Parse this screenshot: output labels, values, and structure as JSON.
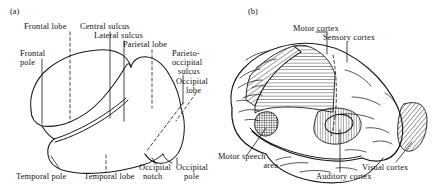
{
  "figure": {
    "background_color": "#ffffff",
    "ink_color": "#1a1a1a",
    "width": 436,
    "height": 189
  },
  "panels": [
    {
      "id": "a",
      "marker": "(a)",
      "title": "Lateral view of cerebral hemisphere with lobes and landmarks",
      "labels": [
        {
          "name": "frontal-lobe",
          "text": "Frontal lobe",
          "leader": "dashed-vertical"
        },
        {
          "name": "central-sulcus",
          "text": "Central sulcus",
          "leader": "solid-vertical"
        },
        {
          "name": "lateral-sulcus",
          "text": "Lateral sulcus",
          "leader": "solid-vertical"
        },
        {
          "name": "parietal-lobe",
          "text": "Parietal lobe",
          "leader": "dashed-vertical"
        },
        {
          "name": "frontal-pole",
          "text": "Frontal\npole",
          "leader": "solid-vertical"
        },
        {
          "name": "parieto-occipital-sulcus",
          "text": "Parieto-\noccipital\nsulcus",
          "leader": "solid-vertical"
        },
        {
          "name": "occipital-lobe",
          "text": "Occipital\nlobe",
          "leader": "dashed-diagonal"
        },
        {
          "name": "temporal-pole",
          "text": "Temporal pole",
          "leader": "solid-diagonal"
        },
        {
          "name": "temporal-lobe",
          "text": "Temporal lobe",
          "leader": "dashed-vertical"
        },
        {
          "name": "occipital-notch",
          "text": "Occipital\nnotch",
          "leader": "solid-diagonal"
        },
        {
          "name": "occipital-pole",
          "text": "Occipital\npole",
          "leader": "solid-vertical"
        }
      ]
    },
    {
      "id": "b",
      "marker": "(b)",
      "title": "Lateral view of cerebral hemisphere with functional cortical areas",
      "labels": [
        {
          "name": "motor-cortex",
          "text": "Motor cortex",
          "hatch": "diagonal",
          "leader": "solid-vertical"
        },
        {
          "name": "sensory-cortex",
          "text": "Sensory cortex",
          "hatch": "horizontal",
          "leader": "solid-vertical"
        },
        {
          "name": "motor-speech-area",
          "text": "Motor speech\narea",
          "hatch": "cross",
          "leader": "solid-diagonal"
        },
        {
          "name": "auditory-cortex",
          "text": "Auditory cortex",
          "hatch": "vertical",
          "leader": "solid-diagonal"
        },
        {
          "name": "visual-cortex",
          "text": "Visual cortex",
          "hatch": "diagonal",
          "leader": "solid-diagonal"
        }
      ]
    }
  ],
  "labels_a": {
    "frontal_lobe": "Frontal lobe",
    "central_sulcus": "Central sulcus",
    "lateral_sulcus": "Lateral sulcus",
    "parietal_lobe": "Parietal lobe",
    "frontal_pole_l1": "Frontal",
    "frontal_pole_l2": "pole",
    "parieto_l1": "Parieto-",
    "parieto_l2": "occipital",
    "parieto_l3": "sulcus",
    "occipital_lobe_l1": "Occipital",
    "occipital_lobe_l2": "lobe",
    "temporal_pole": "Temporal pole",
    "temporal_lobe": "Temporal lobe",
    "occipital_notch_l1": "Occipital",
    "occipital_notch_l2": "notch",
    "occipital_pole_l1": "Occipital",
    "occipital_pole_l2": "pole"
  },
  "labels_b": {
    "motor_cortex": "Motor cortex",
    "sensory_cortex": "Sensory cortex",
    "motor_speech_l1": "Motor speech",
    "motor_speech_l2": "area",
    "auditory_cortex": "Auditory cortex",
    "visual_cortex": "Visual cortex"
  },
  "markers": {
    "a": "(a)",
    "b": "(b)"
  }
}
